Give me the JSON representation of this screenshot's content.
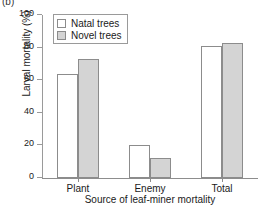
{
  "panel_label": "(b)",
  "chart_data": {
    "type": "bar",
    "title": "",
    "panel": "(b)",
    "categories": [
      "Plant",
      "Enemy",
      "Total"
    ],
    "series": [
      {
        "name": "Natal trees",
        "values": [
          64,
          20,
          81
        ],
        "fill": "#ffffff"
      },
      {
        "name": "Novel trees",
        "values": [
          73,
          12,
          83
        ],
        "fill": "#d4d4d4"
      }
    ],
    "xlabel": "Source of leaf-miner mortality",
    "ylabel": "Larval mortality (%)",
    "ylim": [
      0,
      100
    ],
    "yticks": [
      0,
      20,
      40,
      60,
      80,
      100
    ],
    "ytick_labels": [
      "0",
      "20",
      "40",
      "60",
      "80",
      "100"
    ],
    "grid": false,
    "legend_position": "top-left",
    "legend_entries": [
      "Natal trees",
      "Novel trees"
    ]
  }
}
